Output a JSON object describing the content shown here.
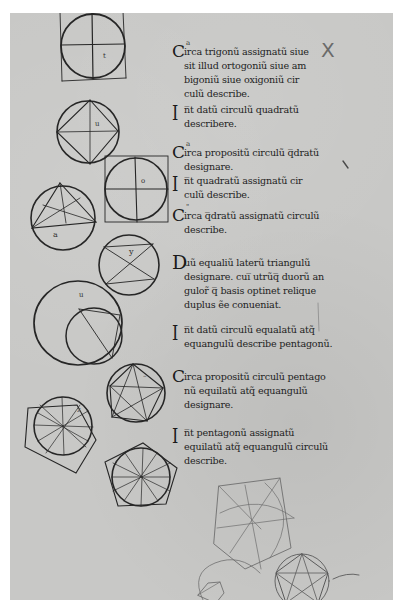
{
  "manuscript": {
    "description": "Scanned manuscript folio with geometric diagrams (Euclid, Elements Book IV) and Latin abbreviated text",
    "colors": {
      "background": "#ffffff",
      "parchment": "#c8c8c6",
      "ink": "#1e1e1e",
      "faint_ink": "#6a6a6a"
    },
    "margin_mark": "X",
    "propositions": [
      {
        "initial": "C",
        "superscript": "a",
        "lines": [
          "irca trigonũ assignatũ siue",
          "sit illud ortogoniũ siue am",
          "bigoniũ siue oxigoniũ cir",
          "culũ describe."
        ]
      },
      {
        "initial": "I",
        "lines": [
          "n̅t datũ circulũ quadratũ",
          "describere."
        ]
      },
      {
        "initial": "C",
        "superscript": "a",
        "lines": [
          "irca propositũ circulũ q̅dratũ",
          "designare."
        ]
      },
      {
        "initial": "I",
        "lines": [
          "n̅t quadratũ assignatũ cir",
          "culũ describe."
        ]
      },
      {
        "initial": "C",
        "superscript": "\"",
        "lines": [
          "irca q̅dratũ assignatũ circulũ",
          "describe."
        ]
      },
      {
        "initial": "D",
        "lines": [
          "uũ equaliũ laterũ triangulũ",
          "designare. cui̅ utrũq̅ duorũ an",
          "gulor̃ q̅ basis optinet relique",
          "duplus ẽe conueniat."
        ]
      },
      {
        "initial": "I",
        "lines": [
          "n̅t datũ circulũ equalatũ atq̃",
          "equangulũ describe pentagonũ."
        ]
      },
      {
        "initial": "C",
        "lines": [
          "irca propositũ circulũ pentago",
          "nũ equilatũ atq̃ equangulũ",
          "designare."
        ]
      },
      {
        "initial": "I",
        "lines": [
          "n̅t pentagonũ assignatũ",
          "equilatũ atq̃ equangulũ circulũ",
          "describe."
        ]
      }
    ],
    "diagram_labels": {
      "d1": "t",
      "d2": "u",
      "d3": "o",
      "d4": "a",
      "d5": "y",
      "d6": "u",
      "d7": "–",
      "d8": "z"
    }
  }
}
